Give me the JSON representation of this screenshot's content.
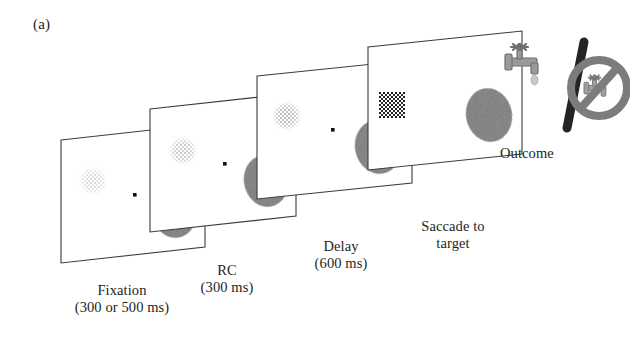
{
  "figure": {
    "panel_label": "(a)",
    "background_color": "#ffffff",
    "line_color": "#333333"
  },
  "stages": [
    {
      "id": "fixation",
      "caption": "Fixation\n(300 or 500 ms)",
      "name": "Fixation",
      "duration": "300 or 500 ms",
      "has_fixation_dot": true,
      "has_target_blob": true,
      "cue_contrast": "very-low",
      "cue_name": "random-dot-cue"
    },
    {
      "id": "rc",
      "caption": "RC\n(300 ms)",
      "name": "RC",
      "duration": "300 ms",
      "has_fixation_dot": true,
      "has_target_blob": true,
      "cue_contrast": "low",
      "cue_name": "random-dot-cue"
    },
    {
      "id": "delay",
      "caption": "Delay\n(600 ms)",
      "name": "Delay",
      "duration": "600 ms",
      "has_fixation_dot": true,
      "has_target_blob": true,
      "cue_contrast": "medium",
      "cue_name": "random-dot-cue"
    },
    {
      "id": "saccade",
      "caption": "Saccade to\ntarget",
      "name": "Saccade to target",
      "duration": "",
      "has_fixation_dot": false,
      "has_target_blob": true,
      "cue_contrast": "high",
      "cue_name": "random-dot-cue"
    }
  ],
  "outcome": {
    "label": "Outcome",
    "reward_icon": "water-faucet-icon",
    "separator_icon": "slash-icon",
    "no_reward_icon": "no-water-faucet-icon",
    "reward_color": "#8a8a8a",
    "prohibition_color": "#7a7a7a"
  },
  "colors": {
    "frame_stroke": "#3a3a3a",
    "fixation_dot": "#111111",
    "target_blob": "#8e8e8e",
    "cue_low": "#cfcfcf",
    "cue_high": "#2b2b2b",
    "text": "#231f20"
  }
}
